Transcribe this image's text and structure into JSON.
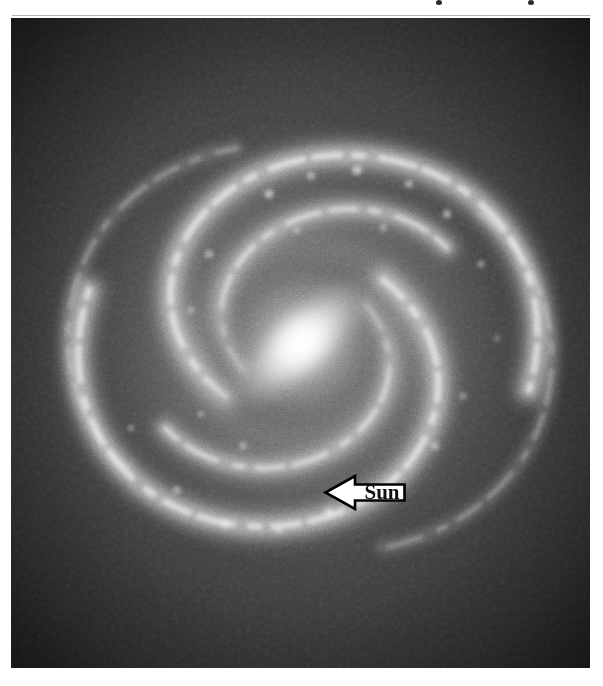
{
  "figure": {
    "frame": {
      "left": 11,
      "top": 18,
      "width": 579,
      "height": 650
    },
    "background_color": "#ffffff",
    "sky_color": "#2a2a2a",
    "arm_color": "#d8d8d8",
    "core_color": "#ffffff"
  },
  "annotations": {
    "sun": {
      "label": "Sun",
      "icon": "left-arrow-icon",
      "direction": "left",
      "fill_color": "#ffffff",
      "stroke_color": "#000000",
      "text_color": "#111111",
      "position": {
        "left": 313,
        "top": 453,
        "width": 82,
        "height": 43
      }
    }
  },
  "galaxy_structure": {
    "type": "barred-spiral",
    "center": {
      "x": 290,
      "y": 320
    },
    "bar": {
      "length": 196,
      "width": 84,
      "angle_deg": -42
    },
    "nucleus": {
      "width": 96,
      "height": 72
    },
    "disc": {
      "width": 470,
      "height": 455
    },
    "arm_count": 4,
    "arm_winding": "counterclockwise"
  },
  "artifacts": {
    "top_marks": [
      {
        "left": 436,
        "top": 0,
        "note": "cut-off-descender"
      },
      {
        "left": 528,
        "top": 0,
        "note": "cut-off-descender"
      }
    ]
  }
}
